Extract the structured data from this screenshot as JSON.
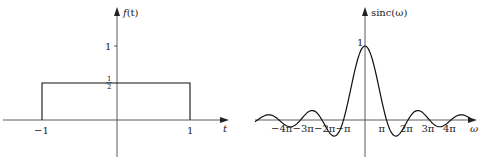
{
  "chart_data": [
    {
      "type": "line",
      "title": "",
      "ylabel": "f(t)",
      "xlabel": "t",
      "x_ticks": [
        "-1",
        "1"
      ],
      "y_ticks": [
        "1/2",
        "1"
      ],
      "x": [
        -1,
        -1,
        1,
        1
      ],
      "values": [
        0,
        0.5,
        0.5,
        0
      ],
      "description": "Rectangular pulse of height 1/2 on [-1, 1]",
      "grid": false
    },
    {
      "type": "line",
      "title": "",
      "ylabel": "sinc(ω)",
      "xlabel": "ω",
      "x_ticks": [
        "−4π",
        "−3π",
        "−2π",
        "−π",
        "π",
        "2π",
        "3π",
        "4π"
      ],
      "y_ticks": [
        "1"
      ],
      "function": "sin(ω)/ω",
      "x": [
        -12.566,
        -9.425,
        -6.283,
        -4.493,
        -3.142,
        0,
        3.142,
        4.493,
        6.283,
        9.425,
        12.566
      ],
      "values": [
        0,
        0,
        0,
        -0.217,
        0,
        1,
        0,
        -0.217,
        0,
        0,
        0
      ],
      "grid": false
    }
  ],
  "left": {
    "ylabel_f": "f",
    "ylabel_arg": "(t)",
    "xlabel": "t",
    "tick_one": "1",
    "half_num": "1",
    "half_den": "2",
    "tick_neg1": "−1",
    "tick_pos1": "1"
  },
  "right": {
    "ylabel": "sinc(ω)",
    "xlabel": "ω",
    "peak": "1",
    "ticks": [
      "−4π",
      "−3π",
      "−2π",
      "−π",
      "π",
      "2π",
      "3π",
      "4π"
    ]
  }
}
